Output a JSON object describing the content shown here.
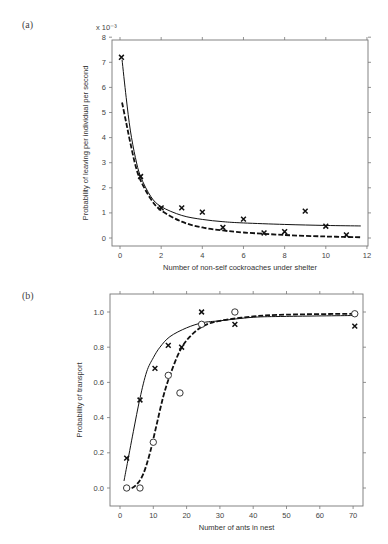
{
  "chart_data": [
    {
      "panel": "(a)",
      "type": "scatter",
      "xlabel": "Number of non-self cockroaches under shelter",
      "ylabel": "Probability of leaving per individual per second",
      "y_multiplier": "x 10⁻³",
      "xlim": [
        0,
        12
      ],
      "ylim": [
        0,
        8
      ],
      "xticks": [
        "0",
        "2",
        "4",
        "6",
        "8",
        "10",
        "12"
      ],
      "yticks": [
        "0",
        "1",
        "2",
        "3",
        "4",
        "5",
        "6",
        "7",
        "8"
      ],
      "grid": false,
      "series": [
        {
          "name": "observed",
          "marker": "x",
          "x": [
            0.07,
            1,
            2,
            3,
            4,
            5,
            6,
            7,
            8,
            9,
            10,
            11
          ],
          "y": [
            7.2,
            2.45,
            1.2,
            1.2,
            1.03,
            0.42,
            0.75,
            0.2,
            0.25,
            1.07,
            0.47,
            0.12
          ]
        },
        {
          "name": "model fit (solid)",
          "style": "solid",
          "x": [
            0.1,
            0.3,
            0.5,
            0.75,
            1,
            1.5,
            2,
            3,
            4,
            5,
            6,
            8,
            10,
            11.7
          ],
          "y": [
            7.1,
            5.6,
            4.3,
            3.2,
            2.45,
            1.65,
            1.25,
            0.9,
            0.74,
            0.65,
            0.6,
            0.54,
            0.5,
            0.48
          ]
        },
        {
          "name": "model fit (dashed)",
          "style": "dashed",
          "x": [
            0.1,
            0.3,
            0.5,
            0.75,
            1,
            1.5,
            2,
            3,
            4,
            5,
            6,
            8,
            10,
            11.7
          ],
          "y": [
            5.4,
            4.6,
            3.8,
            2.9,
            2.3,
            1.55,
            1.1,
            0.65,
            0.42,
            0.3,
            0.22,
            0.12,
            0.06,
            0.03
          ]
        }
      ]
    },
    {
      "panel": "(b)",
      "type": "scatter",
      "xlabel": "Number of ants in nest",
      "ylabel": "Probability of transport",
      "xlim": [
        -3,
        73
      ],
      "ylim": [
        -0.1,
        1.1
      ],
      "xticks": [
        "0",
        "10",
        "20",
        "30",
        "40",
        "50",
        "60",
        "70"
      ],
      "yticks": [
        "0.0",
        "0.2",
        "0.4",
        "0.6",
        "0.8",
        "1.0"
      ],
      "grid": false,
      "series": [
        {
          "name": "crosses",
          "marker": "x",
          "x": [
            2,
            6,
            10.5,
            14.5,
            18.5,
            24.5,
            34.5,
            70.5
          ],
          "y": [
            0.17,
            0.5,
            0.68,
            0.81,
            0.8,
            1.0,
            0.93,
            0.92
          ]
        },
        {
          "name": "circles",
          "marker": "o",
          "x": [
            2,
            6,
            10,
            14.5,
            18,
            24.5,
            34.5,
            70.5
          ],
          "y": [
            0.0,
            0.0,
            0.26,
            0.64,
            0.54,
            0.93,
            1.0,
            0.99
          ]
        },
        {
          "name": "fit to crosses (solid)",
          "style": "solid",
          "x": [
            1.2,
            2,
            4,
            6,
            8,
            10,
            12,
            15,
            20,
            25,
            30,
            40,
            50,
            70
          ],
          "y": [
            0.04,
            0.12,
            0.32,
            0.51,
            0.66,
            0.74,
            0.8,
            0.86,
            0.91,
            0.94,
            0.95,
            0.97,
            0.975,
            0.98
          ]
        },
        {
          "name": "fit to circles (dashed)",
          "style": "dashed",
          "x": [
            1.5,
            3,
            5,
            7,
            9,
            11,
            13,
            15,
            18,
            21,
            25,
            30,
            40,
            50,
            70
          ],
          "y": [
            0.0,
            -0.005,
            0.02,
            0.08,
            0.2,
            0.36,
            0.52,
            0.64,
            0.78,
            0.86,
            0.92,
            0.95,
            0.975,
            0.985,
            0.99
          ]
        }
      ]
    }
  ],
  "panels": {
    "a": {
      "label": "(a)"
    },
    "b": {
      "label": "(b)"
    }
  }
}
